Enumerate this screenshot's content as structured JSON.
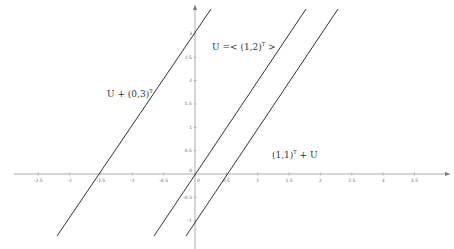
{
  "diagram": {
    "type": "coordinate-plane-lines",
    "axes": {
      "x_ticks": [
        "-2.5",
        "-2",
        "-1.5",
        "-1",
        "-0.5",
        "0",
        "0.5",
        "1",
        "1.5",
        "2",
        "2.5",
        "3",
        "3.5"
      ],
      "x_tick_values": [
        -2.5,
        -2,
        -1.5,
        -1,
        -0.5,
        0,
        0.5,
        1,
        1.5,
        2,
        2.5,
        3,
        3.5
      ],
      "y_ticks": [
        "3",
        "2.5",
        "2",
        "1.5",
        "1",
        "0.5",
        "0",
        "-0.5",
        "-1"
      ],
      "y_tick_values": [
        3,
        2.5,
        2,
        1.5,
        1,
        0.5,
        0,
        -0.5,
        -1
      ],
      "origin_label": "0",
      "axis_color": "#999999",
      "line_color": "#333333"
    },
    "lines": [
      {
        "id": "U-shift",
        "label_main": "U + (0,3)",
        "label_sup": "T",
        "equation": "y = 2x + 3",
        "x_intercept": -1.5
      },
      {
        "id": "U",
        "label_main": "U =< (1,2)",
        "label_sup": "T",
        "label_tail": " >",
        "equation": "y = 2x",
        "x_intercept": 0
      },
      {
        "id": "affine",
        "label_main": "(1,1)",
        "label_sup": "T",
        "label_tail": " + U",
        "equation": "y = 2x - 1",
        "x_intercept": 0.5
      }
    ]
  }
}
